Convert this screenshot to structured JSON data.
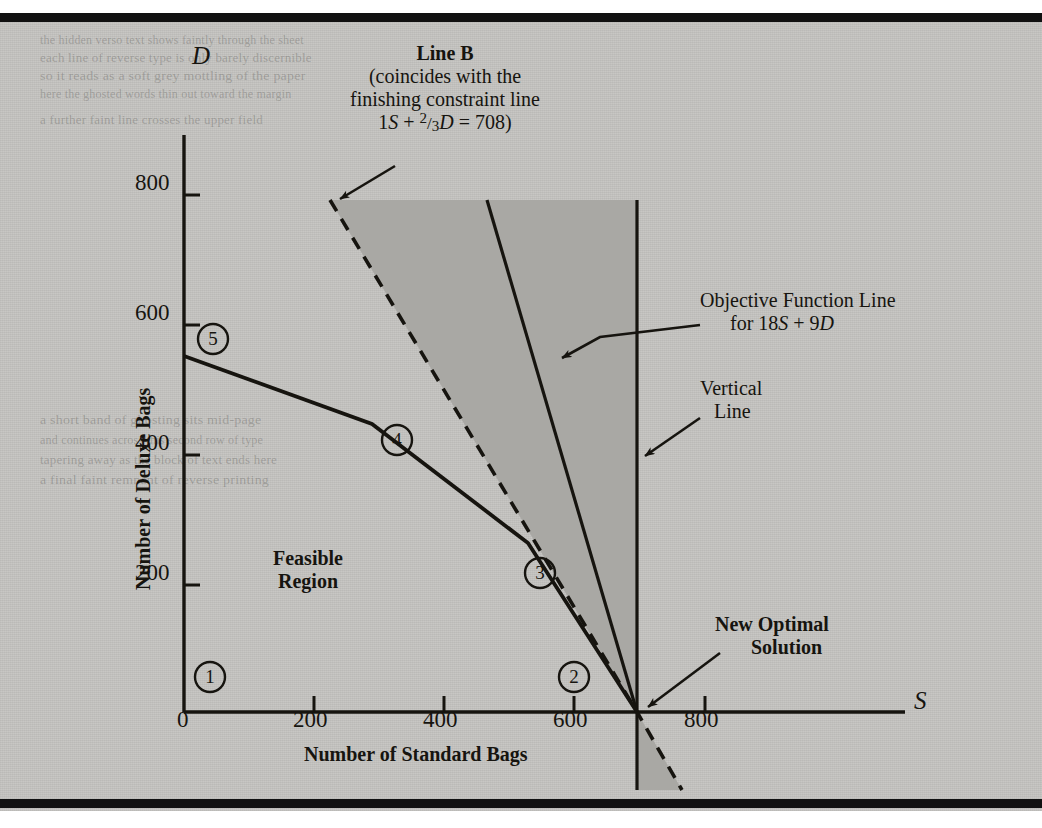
{
  "figure": {
    "kind": "linear-programming-graph",
    "background_color": "#c6c5c2",
    "ink_color": "#16140f",
    "shade_color": "#a9a8a4"
  },
  "axes": {
    "x": {
      "variable": "S",
      "title": "Number of Standard Bags",
      "ticks": [
        "0",
        "200",
        "400",
        "600",
        "800"
      ],
      "tick_values": [
        0,
        200,
        400,
        600,
        800
      ],
      "range": [
        0,
        1000
      ]
    },
    "y": {
      "variable": "D",
      "title": "Number of Deluxe Bags",
      "ticks": [
        "200",
        "400",
        "600",
        "800"
      ],
      "tick_values": [
        200,
        400,
        600,
        800
      ],
      "range": [
        0,
        900
      ]
    }
  },
  "annotations": {
    "line_b": {
      "title": "Line B",
      "line1": "(coincides with the",
      "line2": "finishing constraint line",
      "eq_prefix": "1",
      "eq_s": "S",
      "eq_plus": "+",
      "eq_frac_num": "2",
      "eq_frac_slash": "/",
      "eq_frac_den": "3",
      "eq_d": "D",
      "eq_tail": "= 708)"
    },
    "objective": {
      "line1": "Objective Function Line",
      "line2_prefix": "for 18",
      "line2_s": "S",
      "line2_mid": " + 9",
      "line2_d": "D"
    },
    "vertical_line": {
      "line1": "Vertical",
      "line2": "Line"
    },
    "optimal": {
      "line1": "New Optimal",
      "line2": "Solution"
    },
    "feasible": {
      "line1": "Feasible",
      "line2": "Region"
    }
  },
  "vertex_markers": [
    {
      "label": "1",
      "x": 0,
      "y": 0
    },
    {
      "label": "2",
      "x": 600,
      "y": 0
    },
    {
      "label": "3",
      "x": 530,
      "y": 260
    },
    {
      "label": "4",
      "x": 320,
      "y": 470
    },
    {
      "label": "5",
      "x": 40,
      "y": 570
    }
  ],
  "bleed_text": [
    {
      "text": "the hidden verso text shows faintly through the sheet",
      "x": 40,
      "y": 20
    },
    {
      "text": "each line of reverse type is only barely discernible",
      "x": 40,
      "y": 38
    },
    {
      "text": "so it reads as a soft grey mottling of the paper",
      "x": 40,
      "y": 56
    },
    {
      "text": "here the ghosted words thin out toward the margin",
      "x": 40,
      "y": 74
    },
    {
      "text": "a further faint line crosses the upper field",
      "x": 40,
      "y": 100
    },
    {
      "text": "a short band of ghosting sits mid-page",
      "x": 40,
      "y": 400
    },
    {
      "text": "and continues across this second row of type",
      "x": 40,
      "y": 420
    },
    {
      "text": "tapering away as the block of text ends here",
      "x": 40,
      "y": 440
    },
    {
      "text": "a final faint remnant of reverse printing",
      "x": 40,
      "y": 460
    }
  ],
  "chart_data": {
    "type": "line",
    "title": "",
    "xlabel": "Number of Standard Bags",
    "ylabel": "Number of Deluxe Bags",
    "xlim": [
      0,
      1000
    ],
    "ylim": [
      0,
      900
    ],
    "grid": false,
    "legend": "none",
    "series": [
      {
        "name": "Feasible region upper boundary (binding constraints)",
        "style": "solid",
        "points": [
          [
            0,
            550
          ],
          [
            290,
            445
          ],
          [
            530,
            262
          ],
          [
            696,
            0
          ]
        ]
      },
      {
        "name": "Line B / finishing constraint 1S + 2/3D = 708",
        "style": "dashed",
        "points": [
          [
            225,
            785
          ],
          [
            696,
            0
          ],
          [
            760,
            -120
          ]
        ]
      },
      {
        "name": "Objective Function Line 18S + 9D",
        "style": "solid",
        "points": [
          [
            462,
            790
          ],
          [
            696,
            0
          ]
        ]
      },
      {
        "name": "Vertical Line",
        "style": "solid",
        "points": [
          [
            696,
            790
          ],
          [
            696,
            -120
          ]
        ]
      }
    ],
    "shaded_regions": [
      {
        "name": "Shaded wedge between Line B and the vertical line",
        "vertices": [
          [
            225,
            785
          ],
          [
            696,
            785
          ],
          [
            696,
            0
          ]
        ]
      },
      {
        "name": "Small shaded sliver below the axis",
        "vertices": [
          [
            696,
            0
          ],
          [
            696,
            -120
          ],
          [
            760,
            -120
          ]
        ]
      }
    ],
    "annotations": [
      {
        "text": "Line B (coincides with the finishing constraint line 1S + 2/3D = 708)",
        "points_to": [
          225,
          785
        ]
      },
      {
        "text": "Objective Function Line for 18S + 9D",
        "points_to": [
          510,
          420
        ]
      },
      {
        "text": "Vertical Line",
        "points_to": [
          696,
          460
        ]
      },
      {
        "text": "New Optimal Solution",
        "points_to": [
          696,
          0
        ]
      },
      {
        "text": "Feasible Region",
        "points_to": [
          260,
          215
        ]
      }
    ]
  }
}
